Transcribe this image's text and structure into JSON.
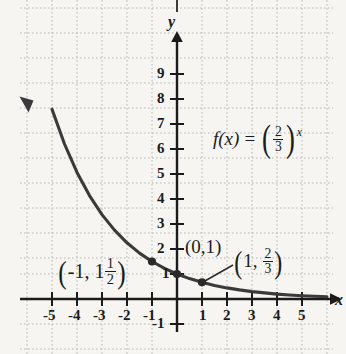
{
  "figure": {
    "kind": "math-graph",
    "background_color": "#f6f5f1",
    "grid_color": "#b9b9b4",
    "ink_color": "#1b1b1b",
    "curve_color": "#3a3a3a"
  },
  "axes": {
    "x_name": "x",
    "y_name": "y",
    "x_ticks": [
      "-5",
      "-4",
      "-3",
      "-2",
      "-1",
      "1",
      "2",
      "3",
      "4",
      "5"
    ],
    "y_ticks": [
      "9",
      "8",
      "7",
      "6",
      "5",
      "4",
      "3",
      "2",
      "1",
      "-1"
    ]
  },
  "function_label": {
    "lhs": "f(x)",
    "equals": "=",
    "base_numerator": "2",
    "base_denominator": "3",
    "exponent": "x",
    "plain": "f(x) = (2/3)^x"
  },
  "points": [
    {
      "id": "p-neg1",
      "lead": "-1",
      "second_whole": "1",
      "second_num": "1",
      "second_den": "2",
      "plain": "(-1, 1 1/2)"
    },
    {
      "id": "p-zero",
      "plain": "(0,1)"
    },
    {
      "id": "p-one",
      "lead": "1",
      "second_num": "2",
      "second_den": "3",
      "plain": "(1, 2/3)"
    }
  ],
  "chart_data": {
    "type": "line",
    "title": "",
    "xlabel": "x",
    "ylabel": "y",
    "grid": true,
    "legend": "none",
    "xlim": [
      -5.6,
      5.6
    ],
    "ylim": [
      -1.4,
      9.8
    ],
    "series": [
      {
        "name": "f(x) = (2/3)^x",
        "expression": "(2/3)^x",
        "x": [
          -5,
          -4.5,
          -4,
          -3.5,
          -3,
          -2.5,
          -2,
          -1.5,
          -1,
          -0.5,
          0,
          0.5,
          1,
          1.5,
          2,
          2.5,
          3,
          3.5,
          4,
          4.5,
          5,
          5.5,
          6
        ],
        "values": [
          7.594,
          6.2,
          5.063,
          4.134,
          3.375,
          2.756,
          2.25,
          1.837,
          1.5,
          1.225,
          1.0,
          0.816,
          0.667,
          0.544,
          0.444,
          0.363,
          0.296,
          0.242,
          0.198,
          0.161,
          0.132,
          0.108,
          0.088
        ]
      }
    ],
    "annotated_points": [
      {
        "x": -1,
        "y": 1.5,
        "label": "(-1, 1 1/2)"
      },
      {
        "x": 0,
        "y": 1,
        "label": "(0,1)"
      },
      {
        "x": 1,
        "y": 0.6667,
        "label": "(1, 2/3)"
      }
    ]
  }
}
